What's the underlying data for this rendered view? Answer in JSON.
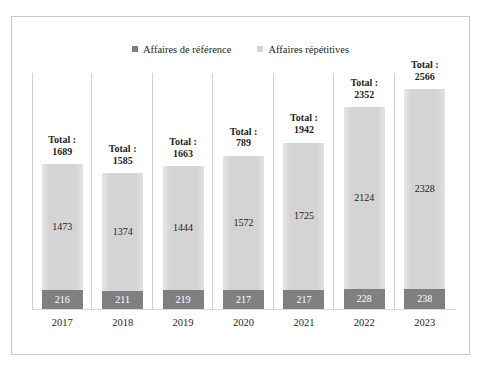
{
  "chart_data": {
    "type": "bar",
    "stacked": true,
    "title": "",
    "xlabel": "",
    "ylabel": "",
    "grid": false,
    "axis_visible": false,
    "legend_position": "top-center",
    "categories": [
      "2017",
      "2018",
      "2019",
      "2020",
      "2021",
      "2022",
      "2023"
    ],
    "series": [
      {
        "name": "Affaires de référence",
        "color": "#808080",
        "values": [
          216,
          211,
          219,
          217,
          217,
          228,
          238
        ]
      },
      {
        "name": "Affaires répétitives",
        "color": "#d4d4d4",
        "values": [
          1473,
          1374,
          1444,
          1572,
          1725,
          2124,
          2328
        ]
      }
    ],
    "total_prefix": "Total :",
    "totals": [
      "1689",
      "1585",
      "1663",
      "789",
      "1942",
      "2352",
      "2566"
    ],
    "ylim": [
      0,
      2566
    ],
    "bars": [
      {
        "category": "2017",
        "total_line1": "Total :",
        "total_line2": "1689",
        "rep": "1473",
        "ref": "216"
      },
      {
        "category": "2018",
        "total_line1": "Total :",
        "total_line2": "1585",
        "rep": "1374",
        "ref": "211"
      },
      {
        "category": "2019",
        "total_line1": "Total :",
        "total_line2": "1663",
        "rep": "1444",
        "ref": "219"
      },
      {
        "category": "2020",
        "total_line1": "Total :",
        "total_line2": "789",
        "rep": "1572",
        "ref": "217"
      },
      {
        "category": "2021",
        "total_line1": "Total :",
        "total_line2": "1942",
        "rep": "1725",
        "ref": "217"
      },
      {
        "category": "2022",
        "total_line1": "Total :",
        "total_line2": "2352",
        "rep": "2124",
        "ref": "228"
      },
      {
        "category": "2023",
        "total_line1": "Total :",
        "total_line2": "2566",
        "rep": "2328",
        "ref": "238"
      }
    ]
  },
  "legend": {
    "items": [
      {
        "label": "Affaires de référence",
        "color": "#808080"
      },
      {
        "label": "Affaires répétitives",
        "color": "#d4d4d4"
      }
    ]
  }
}
